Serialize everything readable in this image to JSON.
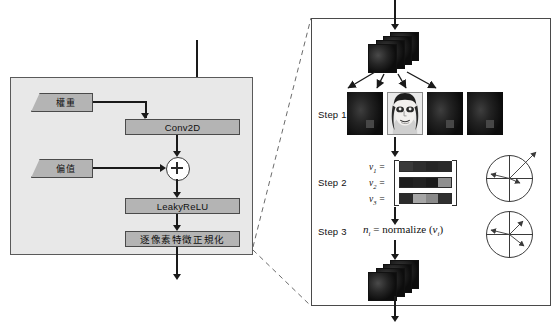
{
  "figure": {
    "type": "neural-network-block-diagram",
    "left_panel": {
      "name": "conv-block",
      "params": [
        {
          "id": "weight",
          "label": "權重"
        },
        {
          "id": "bias",
          "label": "偏值"
        }
      ],
      "blocks": [
        {
          "id": "conv2d",
          "label": "Conv2D"
        },
        {
          "id": "add",
          "label": "+"
        },
        {
          "id": "leakyrelu",
          "label": "LeakyReLU"
        },
        {
          "id": "pixelnorm",
          "label": "逐像素特徵正規化"
        }
      ]
    },
    "right_panel": {
      "name": "pixelwise-feature-normalization-detail",
      "steps": [
        {
          "id": "step1",
          "label": "Step 1"
        },
        {
          "id": "step2",
          "label": "Step 2"
        },
        {
          "id": "step3",
          "label": "Step 3"
        }
      ],
      "vectors": [
        {
          "label": "v",
          "index": "1",
          "equals": "=",
          "cells": [
            "#3a3a3a",
            "#2e2e2e",
            "#262626",
            "#2a2a2a"
          ]
        },
        {
          "label": "v",
          "index": "2",
          "equals": "=",
          "cells": [
            "#1d1d1d",
            "#222222",
            "#1a1a1a",
            "#8f8f8f"
          ]
        },
        {
          "label": "v",
          "index": "3",
          "equals": "=",
          "cells": [
            "#2b2b2b",
            "#a6a6a6",
            "#8a8a8a",
            "#303030"
          ]
        }
      ],
      "formula": {
        "lhs_symbol": "n",
        "lhs_sub": "i",
        "equals": "=",
        "fn": "normalize",
        "arg_symbol": "v",
        "arg_sub": "i",
        "full_text": "n_i = normalize (v_i)"
      },
      "feature_maps_step1": [
        {
          "id": "fm-1",
          "kind": "dark-feature-map"
        },
        {
          "id": "fm-2",
          "kind": "face-image"
        },
        {
          "id": "fm-3",
          "kind": "dark-feature-map"
        },
        {
          "id": "fm-4",
          "kind": "dark-feature-map"
        }
      ],
      "unit_circles": [
        {
          "id": "circle-before",
          "caption": "unnormalized vectors",
          "vector_lengths": [
            34,
            20,
            11
          ]
        },
        {
          "id": "circle-after",
          "caption": "normalized unit vectors",
          "vector_lengths": [
            18,
            18,
            18
          ]
        }
      ]
    },
    "colors": {
      "panel_fill": "#e8e8e8",
      "block_fill": "#b4b4b4",
      "stroke": "#4a4a4a",
      "arrow": "#1a1a1a",
      "page_bg": "#ffffff"
    }
  }
}
